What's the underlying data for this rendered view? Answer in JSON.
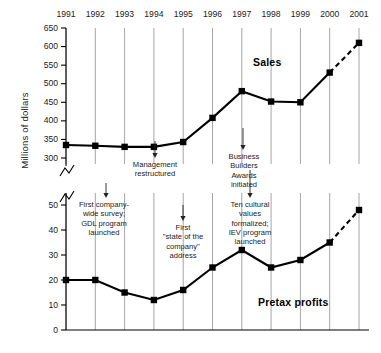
{
  "chart_data": {
    "type": "line",
    "title": "",
    "xlabel": "",
    "ylabel": "Millions of dollars",
    "grid": true,
    "legend_position": "inline-labels",
    "axis_break": true,
    "categories": [
      1991,
      1992,
      1993,
      1994,
      1995,
      1996,
      1997,
      1998,
      1999,
      2000,
      2001
    ],
    "x_tick_labels": [
      "1991",
      "1992",
      "1993",
      "1994",
      "1995",
      "1996",
      "1997",
      "1998",
      "1999",
      "2000",
      "2001"
    ],
    "panels": [
      {
        "name": "sales-panel",
        "ylim": [
          300,
          650
        ],
        "y_tick_labels": [
          "650",
          "600",
          "550",
          "500",
          "450",
          "400",
          "350",
          "300"
        ],
        "y_ticks": [
          650,
          600,
          550,
          500,
          450,
          400,
          350,
          300
        ]
      },
      {
        "name": "pretax-panel",
        "ylim": [
          0,
          50
        ],
        "y_tick_labels": [
          "50",
          "40",
          "30",
          "20",
          "10",
          "0"
        ],
        "y_ticks": [
          50,
          40,
          30,
          20,
          10,
          0
        ]
      }
    ],
    "series": [
      {
        "name": "Sales",
        "panel": "sales-panel",
        "label": "Sales",
        "values": [
          335,
          333,
          330,
          330,
          343,
          408,
          480,
          452,
          450,
          530,
          610
        ],
        "projected_from": 2000,
        "projection_style": "dashed"
      },
      {
        "name": "Pretax profits",
        "panel": "pretax-panel",
        "label": "Pretax profits",
        "values": [
          20,
          20,
          15,
          12,
          16,
          25,
          32,
          25,
          28,
          35,
          48
        ],
        "projected_from": 2000,
        "projection_style": "dashed"
      }
    ],
    "annotations": [
      {
        "id": "first-company-wide-survey",
        "text": "First company-\nwide survey;\nGDL program\nlaunched",
        "lines": [
          "First company-",
          "wide survey;",
          "GDL program",
          "launched"
        ],
        "at_year": 1992
      },
      {
        "id": "management-restructured",
        "text": "Management\nrestructured",
        "lines": [
          "Management",
          "restructured"
        ],
        "at_year": 1994
      },
      {
        "id": "state-of-the-company-address",
        "text": "First\n\"state of the\ncompany\"\naddress",
        "lines": [
          "First",
          "\"state of the",
          "company\"",
          "address"
        ],
        "at_year": 1995
      },
      {
        "id": "business-builders-awards",
        "text": "Business\nBuilders\nAwards\ninitiated",
        "lines": [
          "Business",
          "Builders",
          "Awards",
          "initiated"
        ],
        "at_year": 1997
      },
      {
        "id": "ten-cultural-values",
        "text": "Ten cultural\nvalues\nformalized;\nIEV program\nlaunched",
        "lines": [
          "Ten cultural",
          "values",
          "formalized;",
          "IEV program",
          "launched"
        ],
        "at_year": 1998
      }
    ],
    "colors": {
      "line": "#000000",
      "marker": "#000000",
      "gridline": "#a6a6a6",
      "axis": "#000000",
      "text": "#222222",
      "background": "#ffffff"
    }
  }
}
